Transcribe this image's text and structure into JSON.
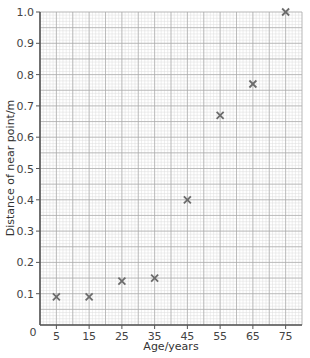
{
  "chart_data": {
    "type": "scatter",
    "title": "",
    "xlabel": "Age/years",
    "ylabel": "Distance of near point/m",
    "xlim": [
      0,
      80
    ],
    "ylim": [
      0,
      1.0
    ],
    "x_ticks": [
      5,
      15,
      25,
      35,
      45,
      55,
      65,
      75
    ],
    "y_ticks": [
      0.1,
      0.2,
      0.3,
      0.4,
      0.5,
      0.6,
      0.7,
      0.8,
      0.9,
      1.0
    ],
    "origin_label": "0",
    "grid": true,
    "marker": "x",
    "x": [
      5,
      15,
      25,
      35,
      45,
      55,
      65,
      75
    ],
    "y": [
      0.09,
      0.09,
      0.14,
      0.15,
      0.4,
      0.67,
      0.77,
      1.0
    ]
  },
  "colors": {
    "minor_grid": "#dcdcdc",
    "major_grid": "#a8a8a8",
    "axis": "#555555",
    "marker": "#6b6b6b"
  }
}
